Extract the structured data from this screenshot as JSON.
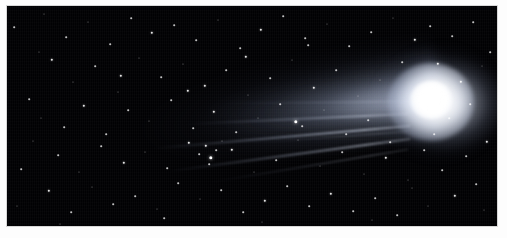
{
  "figure": {
    "kind": "astrophotograph",
    "caption": "",
    "background_color": "#ffffff",
    "plate": {
      "sky_color": "#010103",
      "star_color": "#ffffff",
      "coma_core_color": "#ffffff",
      "tail_color": "#c8d2e6",
      "frame_color": "#d8d8d8",
      "x": 6,
      "y": 5,
      "width": 492,
      "height": 222
    },
    "comet": {
      "coma_center_x": 425,
      "coma_center_y": 95,
      "coma_radius": 22,
      "tail_direction": "upper-left",
      "tail_length": 300,
      "dust_tail_count": 3,
      "ion_streamer_count": 6
    },
    "stars": [
      {
        "x": 14,
        "y": 27,
        "size": 2
      },
      {
        "x": 29,
        "y": 99,
        "size": 2
      },
      {
        "x": 33,
        "y": 141,
        "size": 1
      },
      {
        "x": 21,
        "y": 169,
        "size": 2
      },
      {
        "x": 17,
        "y": 206,
        "size": 1
      },
      {
        "x": 44,
        "y": 14,
        "size": 1
      },
      {
        "x": 52,
        "y": 60,
        "size": 3
      },
      {
        "x": 41,
        "y": 118,
        "size": 1
      },
      {
        "x": 58,
        "y": 155,
        "size": 2
      },
      {
        "x": 49,
        "y": 191,
        "size": 3
      },
      {
        "x": 66,
        "y": 37,
        "size": 2
      },
      {
        "x": 73,
        "y": 82,
        "size": 1
      },
      {
        "x": 64,
        "y": 127,
        "size": 2
      },
      {
        "x": 79,
        "y": 172,
        "size": 1
      },
      {
        "x": 71,
        "y": 212,
        "size": 2
      },
      {
        "x": 88,
        "y": 22,
        "size": 1
      },
      {
        "x": 95,
        "y": 66,
        "size": 2
      },
      {
        "x": 84,
        "y": 106,
        "size": 3
      },
      {
        "x": 101,
        "y": 146,
        "size": 2
      },
      {
        "x": 92,
        "y": 187,
        "size": 1
      },
      {
        "x": 110,
        "y": 44,
        "size": 2
      },
      {
        "x": 118,
        "y": 92,
        "size": 1
      },
      {
        "x": 106,
        "y": 134,
        "size": 2
      },
      {
        "x": 124,
        "y": 163,
        "size": 3
      },
      {
        "x": 113,
        "y": 204,
        "size": 2
      },
      {
        "x": 131,
        "y": 18,
        "size": 2
      },
      {
        "x": 139,
        "y": 58,
        "size": 1
      },
      {
        "x": 128,
        "y": 110,
        "size": 2
      },
      {
        "x": 145,
        "y": 152,
        "size": 1
      },
      {
        "x": 135,
        "y": 196,
        "size": 2
      },
      {
        "x": 152,
        "y": 33,
        "size": 3
      },
      {
        "x": 161,
        "y": 77,
        "size": 2
      },
      {
        "x": 149,
        "y": 121,
        "size": 1
      },
      {
        "x": 167,
        "y": 168,
        "size": 2
      },
      {
        "x": 157,
        "y": 209,
        "size": 1
      },
      {
        "x": 174,
        "y": 25,
        "size": 2
      },
      {
        "x": 183,
        "y": 64,
        "size": 1
      },
      {
        "x": 171,
        "y": 100,
        "size": 2
      },
      {
        "x": 189,
        "y": 143,
        "size": 3
      },
      {
        "x": 178,
        "y": 183,
        "size": 2
      },
      {
        "x": 196,
        "y": 40,
        "size": 2
      },
      {
        "x": 205,
        "y": 86,
        "size": 3
      },
      {
        "x": 193,
        "y": 128,
        "size": 2
      },
      {
        "x": 211,
        "y": 158,
        "size": 4
      },
      {
        "x": 200,
        "y": 199,
        "size": 1
      },
      {
        "x": 218,
        "y": 20,
        "size": 1
      },
      {
        "x": 226,
        "y": 70,
        "size": 2
      },
      {
        "x": 214,
        "y": 112,
        "size": 3
      },
      {
        "x": 232,
        "y": 150,
        "size": 3
      },
      {
        "x": 221,
        "y": 190,
        "size": 2
      },
      {
        "x": 240,
        "y": 48,
        "size": 2
      },
      {
        "x": 248,
        "y": 95,
        "size": 1
      },
      {
        "x": 236,
        "y": 132,
        "size": 2
      },
      {
        "x": 254,
        "y": 172,
        "size": 1
      },
      {
        "x": 243,
        "y": 212,
        "size": 2
      },
      {
        "x": 261,
        "y": 30,
        "size": 3
      },
      {
        "x": 270,
        "y": 78,
        "size": 2
      },
      {
        "x": 258,
        "y": 118,
        "size": 1
      },
      {
        "x": 276,
        "y": 160,
        "size": 2
      },
      {
        "x": 265,
        "y": 201,
        "size": 3
      },
      {
        "x": 283,
        "y": 16,
        "size": 2
      },
      {
        "x": 292,
        "y": 60,
        "size": 1
      },
      {
        "x": 280,
        "y": 104,
        "size": 2
      },
      {
        "x": 298,
        "y": 140,
        "size": 1
      },
      {
        "x": 287,
        "y": 186,
        "size": 2
      },
      {
        "x": 305,
        "y": 38,
        "size": 2
      },
      {
        "x": 314,
        "y": 88,
        "size": 3
      },
      {
        "x": 302,
        "y": 126,
        "size": 2
      },
      {
        "x": 320,
        "y": 166,
        "size": 1
      },
      {
        "x": 309,
        "y": 206,
        "size": 2
      },
      {
        "x": 327,
        "y": 24,
        "size": 1
      },
      {
        "x": 336,
        "y": 70,
        "size": 2
      },
      {
        "x": 324,
        "y": 110,
        "size": 1
      },
      {
        "x": 342,
        "y": 152,
        "size": 2
      },
      {
        "x": 331,
        "y": 194,
        "size": 3
      },
      {
        "x": 349,
        "y": 46,
        "size": 2
      },
      {
        "x": 358,
        "y": 96,
        "size": 1
      },
      {
        "x": 346,
        "y": 134,
        "size": 2
      },
      {
        "x": 364,
        "y": 174,
        "size": 1
      },
      {
        "x": 353,
        "y": 211,
        "size": 2
      },
      {
        "x": 371,
        "y": 32,
        "size": 2
      },
      {
        "x": 380,
        "y": 80,
        "size": 1
      },
      {
        "x": 368,
        "y": 120,
        "size": 2
      },
      {
        "x": 386,
        "y": 158,
        "size": 3
      },
      {
        "x": 375,
        "y": 198,
        "size": 2
      },
      {
        "x": 393,
        "y": 18,
        "size": 1
      },
      {
        "x": 402,
        "y": 62,
        "size": 2
      },
      {
        "x": 390,
        "y": 142,
        "size": 2
      },
      {
        "x": 408,
        "y": 180,
        "size": 1
      },
      {
        "x": 397,
        "y": 215,
        "size": 2
      },
      {
        "x": 415,
        "y": 40,
        "size": 3
      },
      {
        "x": 424,
        "y": 150,
        "size": 2
      },
      {
        "x": 412,
        "y": 188,
        "size": 1
      },
      {
        "x": 430,
        "y": 26,
        "size": 2
      },
      {
        "x": 438,
        "y": 64,
        "size": 3
      },
      {
        "x": 434,
        "y": 134,
        "size": 2
      },
      {
        "x": 442,
        "y": 170,
        "size": 2
      },
      {
        "x": 428,
        "y": 206,
        "size": 1
      },
      {
        "x": 452,
        "y": 36,
        "size": 2
      },
      {
        "x": 461,
        "y": 82,
        "size": 3
      },
      {
        "x": 449,
        "y": 118,
        "size": 2
      },
      {
        "x": 466,
        "y": 156,
        "size": 2
      },
      {
        "x": 455,
        "y": 196,
        "size": 3
      },
      {
        "x": 473,
        "y": 22,
        "size": 2
      },
      {
        "x": 482,
        "y": 66,
        "size": 1
      },
      {
        "x": 470,
        "y": 104,
        "size": 2
      },
      {
        "x": 487,
        "y": 142,
        "size": 3
      },
      {
        "x": 476,
        "y": 184,
        "size": 2
      },
      {
        "x": 490,
        "y": 52,
        "size": 2
      },
      {
        "x": 484,
        "y": 210,
        "size": 1
      },
      {
        "x": 206,
        "y": 146,
        "size": 3
      },
      {
        "x": 199,
        "y": 154,
        "size": 2
      },
      {
        "x": 216,
        "y": 150,
        "size": 2
      },
      {
        "x": 209,
        "y": 164,
        "size": 2
      },
      {
        "x": 222,
        "y": 141,
        "size": 1
      },
      {
        "x": 296,
        "y": 122,
        "size": 4
      },
      {
        "x": 188,
        "y": 91,
        "size": 3
      },
      {
        "x": 246,
        "y": 57,
        "size": 3
      },
      {
        "x": 308,
        "y": 45,
        "size": 2
      },
      {
        "x": 121,
        "y": 76,
        "size": 3
      },
      {
        "x": 39,
        "y": 52,
        "size": 1
      },
      {
        "x": 60,
        "y": 224,
        "size": 1
      },
      {
        "x": 164,
        "y": 218,
        "size": 2
      },
      {
        "x": 372,
        "y": 220,
        "size": 1
      },
      {
        "x": 262,
        "y": 222,
        "size": 1
      }
    ]
  }
}
